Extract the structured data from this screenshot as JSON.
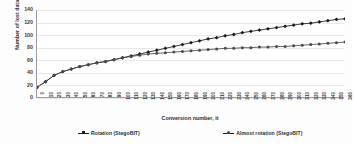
{
  "chart_data": {
    "type": "line",
    "title": "",
    "xlabel": "Conversion number, it",
    "ylabel": "Number of lost data, bit",
    "xlim": [
      0,
      360
    ],
    "ylim": [
      0,
      140
    ],
    "ytick_values": [
      0,
      20,
      40,
      60,
      80,
      100,
      120,
      140
    ],
    "grid": true,
    "legend_position": "bottom",
    "categories": [
      0,
      10,
      20,
      30,
      40,
      50,
      60,
      70,
      80,
      90,
      100,
      110,
      120,
      130,
      140,
      150,
      160,
      170,
      180,
      190,
      200,
      210,
      220,
      230,
      240,
      250,
      260,
      270,
      280,
      290,
      300,
      310,
      320,
      330,
      340,
      350,
      360
    ],
    "xtick_labels": [
      "0",
      "10",
      "20",
      "30",
      "40",
      "50",
      "60",
      "70",
      "80",
      "90",
      "100",
      "110",
      "120",
      "130",
      "140",
      "150",
      "160",
      "170",
      "180",
      "190",
      "200",
      "210",
      "220",
      "230",
      "240",
      "250",
      "260",
      "270",
      "280",
      "290",
      "300",
      "310",
      "320",
      "330",
      "340",
      "350",
      "360"
    ],
    "series": [
      {
        "name": "Rotation (StegoBIT)",
        "color": "#1a1a1a",
        "marker": "diamond",
        "values": [
          17,
          26,
          36,
          42,
          46,
          50,
          53,
          56,
          58,
          61,
          64,
          67,
          70,
          73,
          76,
          79,
          82,
          85,
          88,
          91,
          94,
          96,
          99,
          101,
          104,
          106,
          108,
          110,
          112,
          114,
          116,
          118,
          119,
          121,
          123,
          125,
          126
        ]
      },
      {
        "name": "Almost rotation (StegoBIT)",
        "color": "#4a4a4a",
        "marker": "circle",
        "values": [
          17,
          26,
          36,
          42,
          46,
          50,
          53,
          56,
          58,
          61,
          64,
          66,
          68,
          70,
          71,
          72,
          73,
          74,
          75,
          76,
          77,
          78,
          79,
          79,
          80,
          80,
          81,
          81,
          82,
          82,
          83,
          84,
          85,
          86,
          87,
          88,
          89
        ]
      }
    ]
  },
  "legend": {
    "items": [
      {
        "label": "Rotation (StegoBIT)"
      },
      {
        "label": "Almost rotation (StegoBIT)"
      }
    ]
  }
}
